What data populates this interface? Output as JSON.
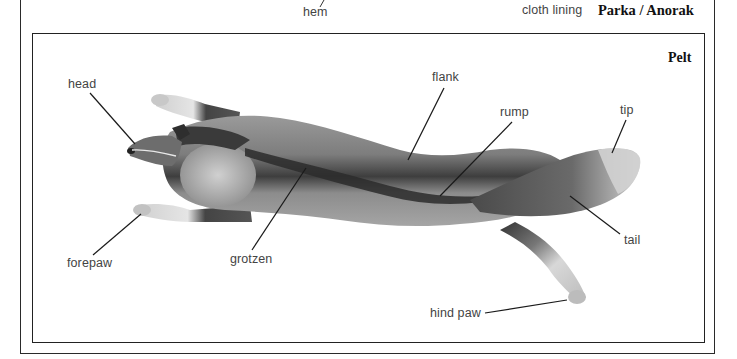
{
  "header": {
    "hem_label": "hem",
    "cloth_lining_label": "cloth lining",
    "section_title": "Parka / Anorak"
  },
  "panel": {
    "title": "Pelt",
    "labels": {
      "head": "head",
      "flank": "flank",
      "rump": "rump",
      "tip": "tip",
      "tail": "tail",
      "forepaw": "forepaw",
      "grotzen": "grotzen",
      "hind_paw": "hind paw"
    }
  },
  "colors": {
    "line": "#1a1a1a",
    "text": "#444444",
    "fur_dark": "#3b3b3b",
    "fur_mid": "#8a8a8a",
    "fur_light": "#d4d4d4"
  }
}
